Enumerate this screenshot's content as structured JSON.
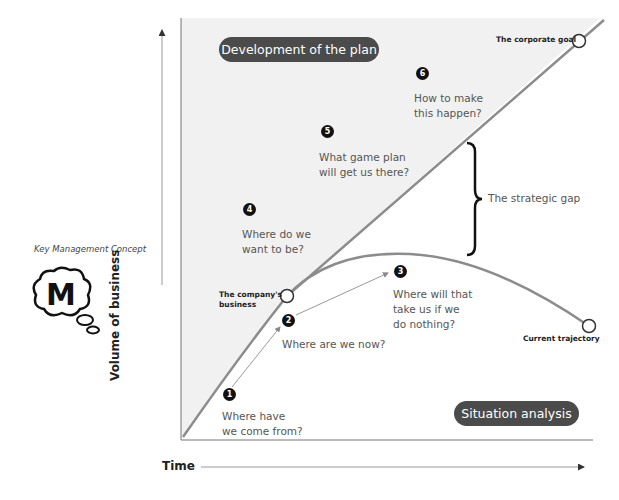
{
  "sidebar": {
    "caption": "Key Management Concept",
    "logo_letter": "M"
  },
  "diagram": {
    "title_top": "Development of the plan",
    "title_bottom": "Situation analysis",
    "y_axis_label": "Volume of business",
    "x_axis_label": "Time",
    "points": {
      "corporate_goal": "The corporate goal",
      "company_business": "The company's\nbusiness",
      "current_trajectory": "Current trajectory"
    },
    "strategic_gap": "The strategic gap",
    "steps": [
      {
        "num": "1",
        "question": "Where have\nwe come from?"
      },
      {
        "num": "2",
        "question": "Where are we now?"
      },
      {
        "num": "3",
        "question": "Where will that\ntake us if we\ndo nothing?"
      },
      {
        "num": "4",
        "question": "Where do we\nwant to be?"
      },
      {
        "num": "5",
        "question": "What game plan\nwill get us there?"
      },
      {
        "num": "6",
        "question": "How to make\nthis happen?"
      }
    ],
    "colors": {
      "plan_region": "#f1f1f1",
      "curve": "#8c8c8c",
      "pill": "#4b4b4b",
      "marker": "#111111"
    }
  }
}
